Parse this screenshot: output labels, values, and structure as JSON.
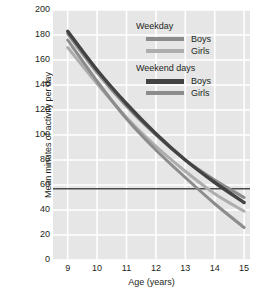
{
  "chart_data": {
    "type": "line",
    "title": "",
    "xlabel": "Age (years)",
    "ylabel": "Mean minutes of activity per day",
    "xlim": [
      8.5,
      15.2
    ],
    "ylim": [
      0,
      200
    ],
    "x": [
      9,
      10,
      11,
      12,
      13,
      14,
      15
    ],
    "xticks": [
      9,
      10,
      11,
      12,
      13,
      14,
      15
    ],
    "yticks": [
      0,
      20,
      40,
      60,
      80,
      100,
      120,
      140,
      160,
      180,
      200
    ],
    "grid": true,
    "legend_position": "top-right",
    "reference_line": {
      "value": 57,
      "label": "",
      "color": "#4d4d4d"
    },
    "series": [
      {
        "name": "Weekday Boys",
        "group": "Weekday",
        "sex": "Boys",
        "color": "#8c8c8c",
        "values": [
          181,
          150,
          123,
          100,
          80,
          64,
          50
        ]
      },
      {
        "name": "Weekday Girls",
        "group": "Weekday",
        "sex": "Girls",
        "color": "#adadad",
        "values": [
          170,
          141,
          114,
          91,
          71,
          53,
          39
        ]
      },
      {
        "name": "Weekend days Boys",
        "group": "Weekend days",
        "sex": "Boys",
        "color": "#434343",
        "values": [
          183,
          152,
          125,
          101,
          80,
          62,
          46
        ]
      },
      {
        "name": "Weekend days Girls",
        "group": "Weekend days",
        "sex": "Girls",
        "color": "#8c8c8c",
        "values": [
          176,
          143,
          113,
          88,
          66,
          45,
          26
        ]
      }
    ]
  },
  "axes": {
    "y_title": "Mean minutes of activity per day",
    "x_title": "Age (years)",
    "y_tick_labels": [
      "200",
      "180",
      "160",
      "140",
      "120",
      "100",
      "80",
      "60",
      "40",
      "20",
      "0"
    ],
    "x_tick_labels": [
      "9",
      "10",
      "11",
      "12",
      "13",
      "14",
      "15"
    ]
  },
  "legend": {
    "groups": [
      {
        "title": "Weekday",
        "entries": [
          {
            "label": "Boys",
            "color": "#8c8c8c",
            "thick": false
          },
          {
            "label": "Girls",
            "color": "#adadad",
            "thick": false
          }
        ]
      },
      {
        "title": "Weekend days",
        "entries": [
          {
            "label": "Boys",
            "color": "#434343",
            "thick": true
          },
          {
            "label": "Girls",
            "color": "#8c8c8c",
            "thick": false
          }
        ]
      }
    ]
  },
  "caption": {
    "text": ""
  },
  "colors": {
    "plot_background": "#e6e6e6",
    "gridline": "#ffffff",
    "axis_line": "#8c8c8c",
    "text": "#231f20"
  }
}
